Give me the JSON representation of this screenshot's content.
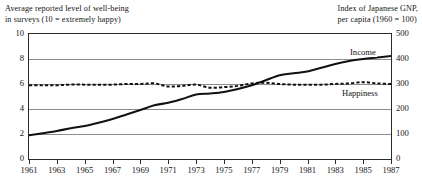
{
  "chart_data": {
    "type": "line",
    "title": "",
    "subtitle": "",
    "left_axis": {
      "label": "Average reported level of well-being\nin surveys (10 = extremely happy)",
      "ticks": [
        0,
        2,
        4,
        6,
        8,
        10
      ],
      "ylim": [
        0,
        10
      ]
    },
    "right_axis": {
      "label": "Index of Japanese GNP,\nper capita (1960 = 100)",
      "ticks": [
        0,
        100,
        200,
        300,
        400,
        500
      ],
      "ylim": [
        0,
        500
      ]
    },
    "xlabel": "",
    "x": [
      1961,
      1962,
      1963,
      1964,
      1965,
      1966,
      1967,
      1968,
      1969,
      1970,
      1971,
      1972,
      1973,
      1974,
      1975,
      1976,
      1977,
      1978,
      1979,
      1980,
      1981,
      1982,
      1983,
      1984,
      1985,
      1986,
      1987
    ],
    "xticks": [
      "1961",
      "1963",
      "1965",
      "1967",
      "1969",
      "1971",
      "1973",
      "1975",
      "1977",
      "1979",
      "1981",
      "1983",
      "1985",
      "1987"
    ],
    "grid": "horizontal",
    "legend_position": "inline-right",
    "series": [
      {
        "name": "Income",
        "axis": "right",
        "style": "solid",
        "color": "#111111",
        "unit": "index (1960 = 100)",
        "values": [
          95,
          103,
          112,
          123,
          132,
          145,
          160,
          178,
          196,
          215,
          225,
          240,
          258,
          262,
          268,
          280,
          295,
          315,
          335,
          343,
          350,
          365,
          380,
          392,
          400,
          406,
          412
        ]
      },
      {
        "name": "Happiness",
        "axis": "left",
        "style": "dashed",
        "color": "#111111",
        "unit": "score out of 10",
        "values": [
          5.9,
          5.9,
          5.9,
          5.95,
          5.95,
          5.95,
          5.95,
          6.0,
          6.0,
          6.05,
          5.8,
          5.85,
          5.95,
          5.7,
          5.75,
          5.85,
          6.05,
          6.1,
          6.0,
          5.95,
          5.95,
          5.95,
          6.0,
          6.05,
          6.15,
          6.05,
          6.0
        ]
      }
    ],
    "annotations": [
      {
        "name": "income-label",
        "text": "Income"
      },
      {
        "name": "happiness-label",
        "text": "Happiness"
      }
    ]
  },
  "labels": {
    "left_caption": "Average reported level of well-being\nin surveys (10 = extremely happy)",
    "right_caption": "Index of Japanese GNP,\nper capita (1960 = 100)",
    "income": "Income",
    "happiness": "Happiness"
  }
}
